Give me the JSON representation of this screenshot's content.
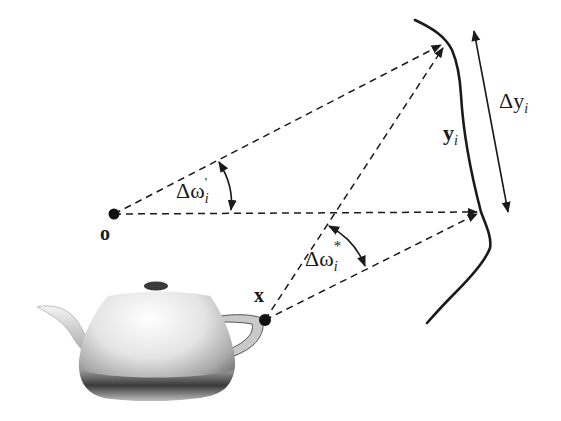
{
  "figure": {
    "points": {
      "o": {
        "label": "o"
      },
      "x": {
        "label": "x"
      }
    },
    "curve": {
      "label": "y",
      "subscript": "i"
    },
    "extent": {
      "prefix": "Δy",
      "subscript": "i"
    },
    "angles": {
      "omega_prime": {
        "base": "Δω",
        "sup": "'",
        "subscript": "i"
      },
      "omega_star": {
        "base": "Δω",
        "sup": "*",
        "subscript": "i"
      }
    },
    "object": {
      "name": "teapot"
    },
    "colors": {
      "ink": "#1a1a1a",
      "background": "#ffffff"
    }
  }
}
